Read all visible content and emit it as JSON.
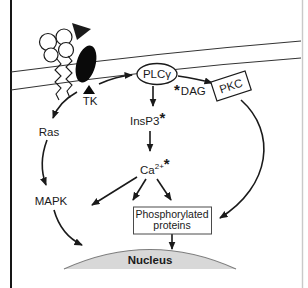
{
  "figure": {
    "type": "cell-signaling-pathway-diagram",
    "labels": {
      "tk": "TK",
      "plc_gamma": "PLCγ",
      "dag_star": "*",
      "dag": "DAG",
      "pkc": "PKC",
      "insp3": "InsP3",
      "insp3_star": "*",
      "ca": "Ca",
      "ca_superscript": "2+",
      "ca_star": "*",
      "ras": "Ras",
      "mapk": "MAPK",
      "phospho_line1": "Phosphorylated",
      "phospho_line2": "proteins",
      "nucleus": "Nucleus"
    },
    "edges": [
      {
        "from": "receptor (TK)",
        "to": "PLCγ"
      },
      {
        "from": "PLCγ",
        "to": "PKC",
        "label": "*DAG"
      },
      {
        "from": "PLCγ",
        "to": "InsP3*"
      },
      {
        "from": "InsP3*",
        "to": "Ca2+*"
      },
      {
        "from": "Ca2+*",
        "to": "cytoplasmic target (left)"
      },
      {
        "from": "Ca2+*",
        "to": "Phosphorylated proteins"
      },
      {
        "from": "Ca2+*",
        "to": "Phosphorylated proteins"
      },
      {
        "from": "TK",
        "to": "Ras"
      },
      {
        "from": "Ras",
        "to": "MAPK"
      },
      {
        "from": "MAPK",
        "to": "Nucleus"
      },
      {
        "from": "PKC",
        "to": "Phosphorylated proteins"
      },
      {
        "from": "Phosphorylated proteins",
        "to": "Nucleus"
      }
    ],
    "colors": {
      "ink": "#1a1a1a",
      "membrane": "#333333",
      "nucleus_fill": "#d8d8d8",
      "nucleus_stroke": "#7d7d7d",
      "frame_left": "#161616",
      "frame_right": "#c9c9c9",
      "background": "#ffffff"
    }
  }
}
